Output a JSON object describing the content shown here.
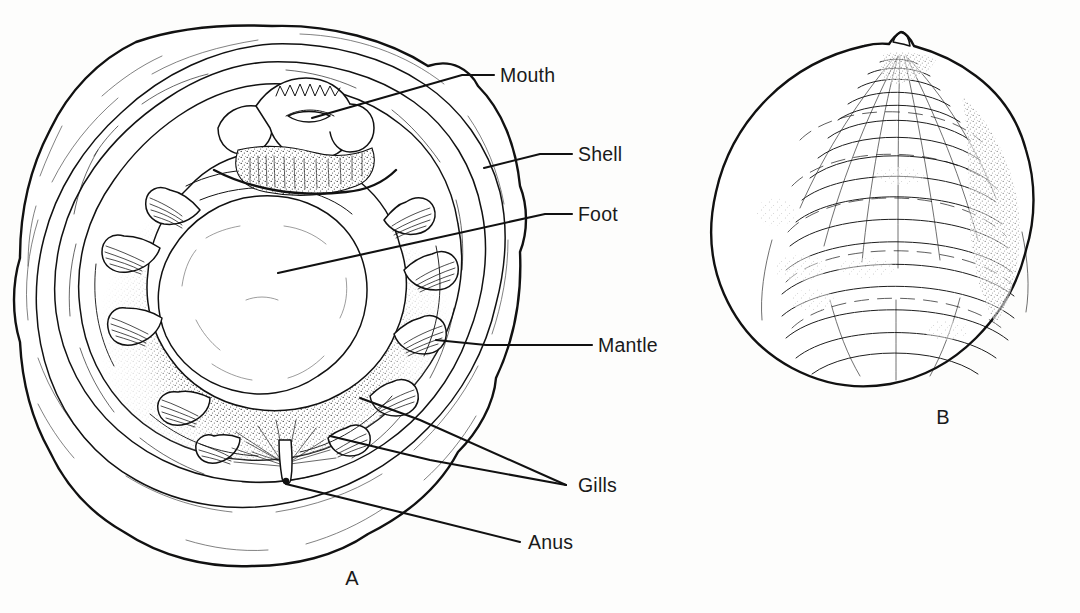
{
  "figure": {
    "domain": "biological-illustration",
    "background_color": "#fdfdfc",
    "ink_color": "#111111",
    "text_color": "#1a1a1a"
  },
  "panels": [
    {
      "id": "A",
      "label": "A",
      "label_x": 352,
      "label_y": 585,
      "caption": "Internal view, upper valve removed"
    },
    {
      "id": "B",
      "label": "B",
      "label_x": 943,
      "label_y": 424,
      "caption": "External view of closed shell"
    }
  ],
  "labels": [
    {
      "id": "mouth",
      "text": "Mouth",
      "text_x": 500,
      "text_y": 82,
      "leader": [
        [
          494,
          75
        ],
        [
          462,
          75
        ],
        [
          312,
          118
        ]
      ],
      "target": "mouth-structure"
    },
    {
      "id": "shell",
      "text": "Shell",
      "text_x": 578,
      "text_y": 161,
      "leader": [
        [
          572,
          154
        ],
        [
          540,
          154
        ],
        [
          484,
          168
        ]
      ],
      "target": "shell-rim"
    },
    {
      "id": "foot",
      "text": "Foot",
      "text_x": 578,
      "text_y": 221,
      "leader": [
        [
          572,
          214
        ],
        [
          545,
          214
        ],
        [
          278,
          273
        ]
      ],
      "target": "foot-mass"
    },
    {
      "id": "mantle",
      "text": "Mantle",
      "text_x": 598,
      "text_y": 352,
      "leader": [
        [
          592,
          345
        ],
        [
          486,
          345
        ],
        [
          436,
          340
        ]
      ],
      "target": "mantle-band"
    },
    {
      "id": "gills",
      "text": "Gills",
      "text_x": 578,
      "text_y": 492,
      "leader_multi": [
        [
          [
            566,
            485
          ],
          [
            420,
            420
          ],
          [
            360,
            398
          ]
        ],
        [
          [
            566,
            485
          ],
          [
            430,
            460
          ],
          [
            330,
            436
          ]
        ]
      ],
      "target": "gill-filaments"
    },
    {
      "id": "anus",
      "text": "Anus",
      "text_x": 528,
      "text_y": 549,
      "leader": [
        [
          520,
          542
        ],
        [
          420,
          517
        ],
        [
          286,
          484
        ]
      ],
      "target": "anus-opening"
    }
  ]
}
